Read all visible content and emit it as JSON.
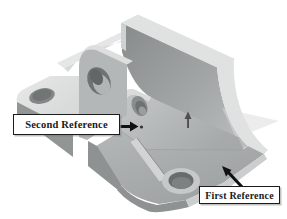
{
  "viewport": {
    "background": "#ffffff"
  },
  "model": {
    "name": "cad-bracket-part",
    "colors": {
      "face_light": "#e0e2e2",
      "face_mid": "#b2b5b5",
      "face_dark": "#8d9090",
      "hole": "#6f7272",
      "ghost_face": "#dfe0e0"
    }
  },
  "callouts": {
    "second": {
      "label": "Second Reference"
    },
    "first": {
      "label": "First Reference"
    }
  },
  "icons": {
    "mate_direction": "up-arrow-icon",
    "second_pointer": "right-arrow-icon",
    "first_pointer": "up-left-arrow-icon"
  },
  "style": {
    "callout_border": "#1c1c1c",
    "callout_bg": "#ffffff",
    "callout_text_color": "#1a1a1a",
    "arrow_color": "#111111"
  }
}
